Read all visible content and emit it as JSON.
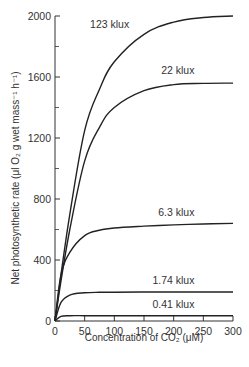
{
  "chart_data": {
    "type": "line",
    "title": "",
    "xlabel": "Concentration of CO₂ (μM)",
    "ylabel": "Net photosynthetic rate (μl O₂ g wet mass⁻¹ h⁻¹)",
    "xlim": [
      0,
      300
    ],
    "ylim": [
      0,
      2000
    ],
    "x_ticks": [
      0,
      50,
      100,
      150,
      200,
      250,
      300
    ],
    "y_ticks": [
      0,
      400,
      800,
      1200,
      1600,
      2000
    ],
    "y_minor_ticks": [
      200,
      600,
      1000,
      1400,
      1800
    ],
    "grid": false,
    "legend": "inline labels",
    "x": [
      0,
      10,
      25,
      50,
      75,
      100,
      150,
      200,
      250,
      300
    ],
    "series": [
      {
        "name": "123 klux",
        "values": [
          0,
          300,
          700,
          1250,
          1520,
          1700,
          1880,
          1960,
          1990,
          2000
        ]
      },
      {
        "name": "22 klux",
        "values": [
          0,
          260,
          600,
          1050,
          1270,
          1400,
          1510,
          1550,
          1558,
          1560
        ]
      },
      {
        "name": "6.3 klux",
        "values": [
          0,
          300,
          450,
          560,
          595,
          610,
          622,
          630,
          636,
          640
        ]
      },
      {
        "name": "1.74 klux",
        "values": [
          0,
          120,
          170,
          185,
          188,
          189,
          190,
          190,
          190,
          190
        ]
      },
      {
        "name": "0.41 klux",
        "values": [
          0,
          30,
          35,
          35,
          35,
          35,
          35,
          35,
          35,
          35
        ]
      }
    ],
    "annotations": [
      {
        "text": "123 klux",
        "x": 125,
        "y": 1920
      },
      {
        "text": "22 klux",
        "x": 235,
        "y": 1620
      },
      {
        "text": "6.3 klux",
        "x": 235,
        "y": 690
      },
      {
        "text": "1.74 klux",
        "x": 235,
        "y": 240
      },
      {
        "text": "0.41 klux",
        "x": 235,
        "y": 85
      }
    ]
  },
  "labels": {
    "xlabel": "Concentration of CO₂ (μM)",
    "ylabel": "Net photosynthetic rate (μl O₂ g wet mass⁻¹ h⁻¹)"
  }
}
